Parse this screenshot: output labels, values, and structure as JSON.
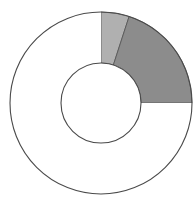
{
  "canvas": {
    "width": 195,
    "height": 205,
    "background": "#ffffff"
  },
  "chart_data": {
    "type": "pie",
    "variant": "donut",
    "title": "",
    "subtitle": "",
    "xlabel": "",
    "ylabel": "",
    "legend": [],
    "legend_position": "none",
    "grid": false,
    "annotations": [],
    "tick_labels": [],
    "geometry": {
      "center_x": 101,
      "center_y": 103,
      "outer_radius": 91,
      "inner_radius": 40,
      "start_angle_deg": 0,
      "direction": "clockwise",
      "total_degrees": 360
    },
    "categories": [
      "Segment A",
      "Segment B",
      "Segment C"
    ],
    "values": [
      5,
      20,
      75
    ],
    "units": "percent",
    "slices": [
      {
        "name": "Segment A",
        "value": 5,
        "percent": 5,
        "start_angle_deg": 0,
        "end_angle_deg": 18,
        "sweep_deg": 18,
        "fill": "#b0b0b0",
        "stroke": "#4a4a4a"
      },
      {
        "name": "Segment B",
        "value": 20,
        "percent": 20,
        "start_angle_deg": 18,
        "end_angle_deg": 90,
        "sweep_deg": 72,
        "fill": "#8c8c8c",
        "stroke": "#4a4a4a"
      },
      {
        "name": "Segment C",
        "value": 75,
        "percent": 75,
        "start_angle_deg": 90,
        "end_angle_deg": 360,
        "sweep_deg": 270,
        "fill": "#ffffff",
        "stroke": "#4a4a4a"
      }
    ]
  },
  "style": {
    "outline_color": "#4a4a4a",
    "outline_width": 1.1,
    "light_gray": "#b0b0b0",
    "dark_gray": "#8c8c8c",
    "white": "#ffffff"
  }
}
